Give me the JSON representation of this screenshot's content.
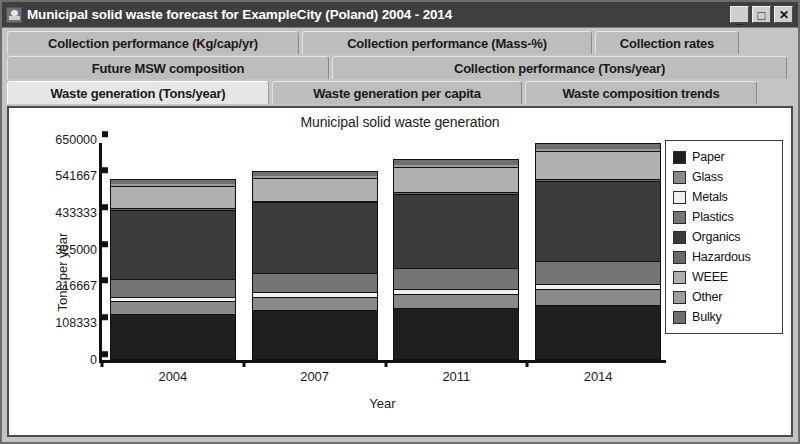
{
  "window": {
    "title": "Municipal solid waste forecast for ExampleCity (Poland) 2004 - 2014",
    "app_icon": "torch-icon",
    "controls": {
      "minimize": "_",
      "maximize": "□",
      "close": "✕"
    }
  },
  "tabs": {
    "row1": [
      {
        "label": "Collection performance (Kg/cap/yr)",
        "selected": false,
        "width": 292
      },
      {
        "label": "Collection performance (Mass-%)",
        "selected": false,
        "width": 290
      },
      {
        "label": "Collection rates",
        "selected": false,
        "width": 144
      }
    ],
    "row2": [
      {
        "label": "Future MSW composition",
        "selected": false,
        "width": 322
      },
      {
        "label": "Collection performance (Tons/year)",
        "selected": false,
        "width": 455
      }
    ],
    "row3": [
      {
        "label": "Waste generation (Tons/year)",
        "selected": true,
        "width": 262
      },
      {
        "label": "Waste generation per capita",
        "selected": false,
        "width": 250
      },
      {
        "label": "Waste composition trends",
        "selected": false,
        "width": 232
      }
    ]
  },
  "chart_data": {
    "type": "bar",
    "subtype": "stacked",
    "title": "Municipal solid waste generation",
    "xlabel": "Year",
    "ylabel": "Tons per year",
    "categories": [
      "2004",
      "2007",
      "2011",
      "2014"
    ],
    "ylim": [
      0,
      650000
    ],
    "yticks": [
      0,
      108333,
      216667,
      325000,
      433333,
      541667,
      650000
    ],
    "ytick_labels": [
      "0",
      "108333",
      "216667",
      "325000",
      "433333",
      "541667",
      "650000"
    ],
    "grid": false,
    "legend_position": "right",
    "series": [
      {
        "name": "Paper",
        "color": "#1f1f1f",
        "values": [
          133000,
          145000,
          150000,
          160000
        ]
      },
      {
        "name": "Glass",
        "color": "#8a8a8a",
        "values": [
          38000,
          40000,
          43000,
          47000
        ]
      },
      {
        "name": "Metals",
        "color": "#f0f0f0",
        "values": [
          13000,
          13000,
          14000,
          15000
        ]
      },
      {
        "name": "Plastics",
        "color": "#757575",
        "values": [
          54000,
          57000,
          62000,
          68000
        ]
      },
      {
        "name": "Organics",
        "color": "#3b3b3b",
        "values": [
          206000,
          210000,
          222000,
          238000
        ]
      },
      {
        "name": "Hazardous",
        "color": "#6a6a6a",
        "values": [
          5000,
          5000,
          5500,
          6000
        ]
      },
      {
        "name": "WEEE",
        "color": "#b0b0b0",
        "values": [
          65000,
          68000,
          75000,
          82000
        ]
      },
      {
        "name": "Other",
        "color": "#9c9c9c",
        "values": [
          8000,
          8500,
          9000,
          10000
        ]
      },
      {
        "name": "Bulky",
        "color": "#6f6f6f",
        "values": [
          12000,
          12500,
          13500,
          15000
        ]
      }
    ],
    "totals": [
      534000,
      559000,
      594000,
      641000
    ]
  },
  "legend": {
    "items": [
      {
        "label": "Paper",
        "color": "#1f1f1f"
      },
      {
        "label": "Glass",
        "color": "#8a8a8a"
      },
      {
        "label": "Metals",
        "color": "#f0f0f0"
      },
      {
        "label": "Plastics",
        "color": "#757575"
      },
      {
        "label": "Organics",
        "color": "#3b3b3b"
      },
      {
        "label": "Hazardous",
        "color": "#6a6a6a"
      },
      {
        "label": "WEEE",
        "color": "#b0b0b0"
      },
      {
        "label": "Other",
        "color": "#9c9c9c"
      },
      {
        "label": "Bulky",
        "color": "#6f6f6f"
      }
    ]
  }
}
